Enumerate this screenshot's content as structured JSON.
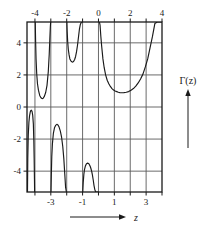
{
  "figure": {
    "title": "",
    "function_label": "Γ(z)",
    "x_axis_label": "z"
  },
  "axes": {
    "x_top_labels": [
      "-4",
      "-2",
      "0",
      "2",
      "4"
    ],
    "x_top_label_values": [
      -4,
      -2,
      0,
      2,
      4
    ],
    "x_bottom_labels": [
      "-3",
      "-1",
      "1",
      "3"
    ],
    "x_bottom_label_values": [
      -3,
      -1,
      1,
      3
    ],
    "y_labels": [
      "4",
      "2",
      "0",
      "-2",
      "-4"
    ],
    "y_label_values": [
      4,
      2,
      0,
      -2,
      -4
    ],
    "xlim": [
      -4.5,
      4.0
    ],
    "ylim": [
      -5.3,
      5.3
    ],
    "x_gridlines": [
      -4,
      -3,
      -2,
      -1,
      0,
      1,
      2,
      3
    ],
    "y_gridlines": [
      4,
      2,
      0,
      -2,
      -4
    ],
    "x_ticks": [
      -4,
      -3,
      -2,
      -1,
      0,
      1,
      2,
      3,
      4
    ],
    "grid": true,
    "frame": true
  },
  "chart_data": {
    "type": "line",
    "title": "",
    "xlabel": "z",
    "ylabel": "Γ(z)",
    "xlim": [
      -4.5,
      4.0
    ],
    "ylim": [
      -5.3,
      5.3
    ],
    "grid": true,
    "legend": "none",
    "annotations": [
      {
        "text": "Γ(z)",
        "position": "right-middle",
        "arrow": "up"
      },
      {
        "text": "z",
        "position": "bottom-center",
        "arrow": "right"
      }
    ],
    "poles": [
      0,
      -1,
      -2,
      -3,
      -4
    ],
    "series": [
      {
        "name": "Gamma branch (-4.5, -4)",
        "sign": "negative-below-axis",
        "x": [
          -4.47,
          -4.45,
          -4.42,
          -4.38,
          -4.34,
          -4.3,
          -4.26,
          -4.22,
          -4.18,
          -4.14,
          -4.1,
          -4.07,
          -4.05,
          -4.03,
          -4.02
        ],
        "values": [
          -5.3,
          -3.2,
          -1.75,
          -0.95,
          -0.55,
          -0.33,
          -0.22,
          -0.2,
          -0.28,
          -0.52,
          -1.05,
          -2.1,
          -3.2,
          -4.5,
          -5.3
        ]
      },
      {
        "name": "Gamma branch (-4, -3)",
        "sign": "positive-above-axis",
        "x": [
          -3.98,
          -3.96,
          -3.93,
          -3.89,
          -3.84,
          -3.78,
          -3.7,
          -3.62,
          -3.55,
          -3.48,
          -3.4,
          -3.32,
          -3.24,
          -3.16,
          -3.1,
          -3.06,
          -3.03,
          -3.01
        ],
        "values": [
          5.3,
          4.2,
          3.0,
          2.1,
          1.45,
          1.05,
          0.72,
          0.58,
          0.52,
          0.55,
          0.68,
          0.92,
          1.35,
          2.2,
          3.3,
          4.3,
          5.0,
          5.3
        ]
      },
      {
        "name": "Gamma branch (-3, -2)",
        "sign": "negative-below-axis",
        "x": [
          -2.99,
          -2.97,
          -2.94,
          -2.9,
          -2.84,
          -2.77,
          -2.7,
          -2.62,
          -2.55,
          -2.48,
          -2.4,
          -2.32,
          -2.25,
          -2.18,
          -2.12,
          -2.07,
          -2.03,
          -2.01
        ],
        "values": [
          -5.3,
          -4.3,
          -3.1,
          -2.3,
          -1.65,
          -1.3,
          -1.15,
          -1.08,
          -1.12,
          -1.25,
          -1.5,
          -1.9,
          -2.45,
          -3.25,
          -4.2,
          -5.0,
          -5.25,
          -5.3
        ]
      },
      {
        "name": "Gamma branch (-2, -1)",
        "sign": "positive-above-axis",
        "x": [
          -1.99,
          -1.97,
          -1.94,
          -1.9,
          -1.85,
          -1.8,
          -1.74,
          -1.68,
          -1.62,
          -1.56,
          -1.5,
          -1.44,
          -1.38,
          -1.32,
          -1.26,
          -1.2,
          -1.14,
          -1.08,
          -1.04,
          -1.01
        ],
        "values": [
          5.3,
          4.7,
          4.1,
          3.6,
          3.25,
          3.0,
          2.88,
          2.82,
          2.8,
          2.85,
          2.96,
          3.15,
          3.45,
          3.85,
          4.35,
          4.85,
          5.15,
          5.28,
          5.3,
          5.3
        ]
      },
      {
        "name": "Gamma branch (-1, 0)",
        "sign": "negative-below-axis",
        "x": [
          -0.99,
          -0.96,
          -0.92,
          -0.88,
          -0.83,
          -0.78,
          -0.73,
          -0.68,
          -0.63,
          -0.58,
          -0.53,
          -0.48,
          -0.43,
          -0.38,
          -0.33,
          -0.28,
          -0.23,
          -0.18,
          -0.13,
          -0.08,
          -0.04,
          -0.02
        ],
        "values": [
          -5.3,
          -4.7,
          -4.2,
          -3.9,
          -3.7,
          -3.58,
          -3.52,
          -3.5,
          -3.52,
          -3.58,
          -3.68,
          -3.82,
          -4.0,
          -4.25,
          -4.55,
          -4.9,
          -5.15,
          -5.28,
          -5.3,
          -5.3,
          -5.3,
          -5.3
        ]
      },
      {
        "name": "Gamma branch (0, 4)",
        "sign": "positive-above-axis",
        "x": [
          0.06,
          0.1,
          0.15,
          0.2,
          0.28,
          0.36,
          0.45,
          0.55,
          0.65,
          0.75,
          0.85,
          0.95,
          1.05,
          1.15,
          1.25,
          1.35,
          1.46,
          1.6,
          1.75,
          1.9,
          2.05,
          2.2,
          2.35,
          2.5,
          2.65,
          2.8,
          2.95,
          3.1,
          3.25,
          3.4,
          3.55,
          3.7,
          3.85,
          4.0
        ],
        "values": [
          5.3,
          5.1,
          4.4,
          3.8,
          3.0,
          2.45,
          2.0,
          1.67,
          1.45,
          1.28,
          1.15,
          1.06,
          1.0,
          0.96,
          0.92,
          0.9,
          0.886,
          0.9,
          0.92,
          0.96,
          1.05,
          1.15,
          1.3,
          1.5,
          1.75,
          2.05,
          2.5,
          3.0,
          3.7,
          4.4,
          5.2,
          5.3,
          5.3,
          5.3
        ]
      }
    ]
  },
  "colors": {
    "curve": "#1a1a1a",
    "grid": "#5a5a5a",
    "frame": "#1a1a1a",
    "background": "#ffffff",
    "text": "#1a1a1a"
  }
}
